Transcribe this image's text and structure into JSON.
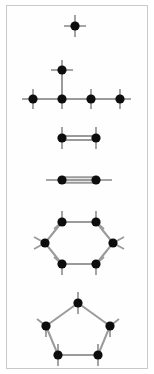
{
  "figure": {
    "background_color": "#ffffff",
    "border_color": "#c9c9c9",
    "panel": {
      "x": 6,
      "y": 5,
      "width": 142,
      "height": 364
    },
    "atom_color": "#0d0d0d",
    "bond_color": "#9a9a9a",
    "atom_radius": 4.6,
    "bond_width": 2.0,
    "stub_width": 1.8,
    "stub_length": 9
  },
  "chart_data": {
    "type": "diagram",
    "subtitle": "Six hydrocarbon skeletal structures stacked vertically",
    "xlabel": "",
    "ylabel": "",
    "xlim": [
      0,
      154
    ],
    "ylim": [
      0,
      374
    ],
    "grid": false,
    "legend": "none",
    "atom_count_total": 19,
    "molecules": [
      {
        "index": 1,
        "name": "methane",
        "label": "CH4",
        "shape": "single-atom-cross",
        "atom_count": 1,
        "bond_count": 0,
        "free_stubs": 4,
        "atoms": [
          {
            "id": "a1",
            "x": 75,
            "y": 26
          }
        ],
        "bonds": [],
        "stubs": [
          {
            "atom": "a1",
            "dx": 0,
            "dy": -11
          },
          {
            "atom": "a1",
            "dx": 0,
            "dy": 11
          },
          {
            "atom": "a1",
            "dx": -11,
            "dy": 0
          },
          {
            "atom": "a1",
            "dx": 11,
            "dy": 0
          }
        ]
      },
      {
        "index": 2,
        "name": "isobutane",
        "label": "2-methylpropane",
        "shape": "branched-chain",
        "atom_count": 4,
        "bond_count": 3,
        "free_stubs": 10,
        "atoms": [
          {
            "id": "b1",
            "x": 33,
            "y": 99
          },
          {
            "id": "b2",
            "x": 62,
            "y": 99
          },
          {
            "id": "b3",
            "x": 91,
            "y": 99
          },
          {
            "id": "b4",
            "x": 120,
            "y": 99
          },
          {
            "id": "b5",
            "x": 62,
            "y": 70
          }
        ],
        "bonds": [
          {
            "from": "b1",
            "to": "b2",
            "order": 1
          },
          {
            "from": "b2",
            "to": "b3",
            "order": 1
          },
          {
            "from": "b3",
            "to": "b4",
            "order": 1
          },
          {
            "from": "b2",
            "to": "b5",
            "order": 1
          }
        ],
        "stubs": [
          {
            "atom": "b1",
            "dx": -11,
            "dy": 0
          },
          {
            "atom": "b1",
            "dx": 0,
            "dy": -10
          },
          {
            "atom": "b1",
            "dx": 0,
            "dy": 10
          },
          {
            "atom": "b3",
            "dx": 0,
            "dy": -10
          },
          {
            "atom": "b3",
            "dx": 0,
            "dy": 10
          },
          {
            "atom": "b4",
            "dx": 11,
            "dy": 0
          },
          {
            "atom": "b4",
            "dx": 0,
            "dy": -10
          },
          {
            "atom": "b4",
            "dx": 0,
            "dy": 10
          },
          {
            "atom": "b5",
            "dx": 0,
            "dy": -10
          },
          {
            "atom": "b5",
            "dx": -11,
            "dy": 0
          },
          {
            "atom": "b5",
            "dx": 11,
            "dy": 0
          },
          {
            "atom": "b2",
            "dx": 0,
            "dy": 10
          }
        ]
      },
      {
        "index": 3,
        "name": "ethylene",
        "label": "C2H4 double bond",
        "shape": "two-atom-double-bond",
        "atom_count": 2,
        "bond_count": 1,
        "bond_order": 2,
        "free_stubs": 4,
        "atoms": [
          {
            "id": "c1",
            "x": 62,
            "y": 138
          },
          {
            "id": "c2",
            "x": 96,
            "y": 138
          }
        ],
        "bonds": [
          {
            "from": "c1",
            "to": "c2",
            "order": 2
          }
        ],
        "stubs": [
          {
            "atom": "c1",
            "dx": 0,
            "dy": -11
          },
          {
            "atom": "c1",
            "dx": 0,
            "dy": 11
          },
          {
            "atom": "c2",
            "dx": 0,
            "dy": -11
          },
          {
            "atom": "c2",
            "dx": 0,
            "dy": 11
          }
        ]
      },
      {
        "index": 4,
        "name": "acetylene",
        "label": "C2H2 triple bond",
        "shape": "two-atom-triple-bond",
        "atom_count": 2,
        "bond_count": 1,
        "bond_order": 3,
        "free_stubs": 2,
        "atoms": [
          {
            "id": "d1",
            "x": 62,
            "y": 180
          },
          {
            "id": "d2",
            "x": 96,
            "y": 180
          }
        ],
        "bonds": [
          {
            "from": "d1",
            "to": "d2",
            "order": 3
          }
        ],
        "stubs": [
          {
            "atom": "d1",
            "dx": -16,
            "dy": 0
          },
          {
            "atom": "d2",
            "dx": 16,
            "dy": 0
          }
        ]
      },
      {
        "index": 5,
        "name": "cyclohexane",
        "label": "C6H12 ring",
        "shape": "hexagon-ring",
        "atom_count": 6,
        "bond_count": 6,
        "free_stubs": 12,
        "atoms": [
          {
            "id": "e1",
            "x": 62,
            "y": 222
          },
          {
            "id": "e2",
            "x": 96,
            "y": 222
          },
          {
            "id": "e3",
            "x": 113,
            "y": 243
          },
          {
            "id": "e4",
            "x": 96,
            "y": 264
          },
          {
            "id": "e5",
            "x": 62,
            "y": 264
          },
          {
            "id": "e6",
            "x": 45,
            "y": 243
          }
        ],
        "bonds": [
          {
            "from": "e1",
            "to": "e2",
            "order": 1
          },
          {
            "from": "e2",
            "to": "e3",
            "order": 1
          },
          {
            "from": "e3",
            "to": "e4",
            "order": 1
          },
          {
            "from": "e4",
            "to": "e5",
            "order": 1
          },
          {
            "from": "e5",
            "to": "e6",
            "order": 1
          },
          {
            "from": "e6",
            "to": "e1",
            "order": 1
          }
        ],
        "stubs": [
          {
            "atom": "e1",
            "dx": 0,
            "dy": -11
          },
          {
            "atom": "e1",
            "dx": -8,
            "dy": 7
          },
          {
            "atom": "e2",
            "dx": 0,
            "dy": -11
          },
          {
            "atom": "e2",
            "dx": 8,
            "dy": 7
          },
          {
            "atom": "e3",
            "dx": 11,
            "dy": -6
          },
          {
            "atom": "e3",
            "dx": 11,
            "dy": 6
          },
          {
            "atom": "e4",
            "dx": 0,
            "dy": 11
          },
          {
            "atom": "e4",
            "dx": 8,
            "dy": -7
          },
          {
            "atom": "e5",
            "dx": 0,
            "dy": 11
          },
          {
            "atom": "e5",
            "dx": -8,
            "dy": -7
          },
          {
            "atom": "e6",
            "dx": -11,
            "dy": -6
          },
          {
            "atom": "e6",
            "dx": -11,
            "dy": 6
          }
        ]
      },
      {
        "index": 6,
        "name": "cyclopentane",
        "label": "C5H10 ring",
        "shape": "pentagon-ring",
        "atom_count": 5,
        "bond_count": 5,
        "free_stubs": 10,
        "atoms": [
          {
            "id": "f1",
            "x": 78,
            "y": 303
          },
          {
            "id": "f2",
            "x": 110,
            "y": 326
          },
          {
            "id": "f3",
            "x": 98,
            "y": 355
          },
          {
            "id": "f4",
            "x": 58,
            "y": 355
          },
          {
            "id": "f5",
            "x": 46,
            "y": 326
          }
        ],
        "bonds": [
          {
            "from": "f1",
            "to": "f2",
            "order": 1
          },
          {
            "from": "f2",
            "to": "f3",
            "order": 1
          },
          {
            "from": "f3",
            "to": "f4",
            "order": 1
          },
          {
            "from": "f4",
            "to": "f5",
            "order": 1
          },
          {
            "from": "f5",
            "to": "f1",
            "order": 1
          }
        ],
        "stubs": [
          {
            "atom": "f1",
            "dx": 0,
            "dy": -11
          },
          {
            "atom": "f1",
            "dx": 0,
            "dy": 11
          },
          {
            "atom": "f2",
            "dx": 9,
            "dy": -7
          },
          {
            "atom": "f2",
            "dx": 0,
            "dy": 11
          },
          {
            "atom": "f3",
            "dx": 0,
            "dy": 11
          },
          {
            "atom": "f3",
            "dx": 0,
            "dy": -11
          },
          {
            "atom": "f4",
            "dx": 0,
            "dy": 11
          },
          {
            "atom": "f4",
            "dx": 0,
            "dy": -11
          },
          {
            "atom": "f5",
            "dx": -9,
            "dy": -7
          },
          {
            "atom": "f5",
            "dx": 0,
            "dy": 11
          }
        ]
      }
    ]
  }
}
